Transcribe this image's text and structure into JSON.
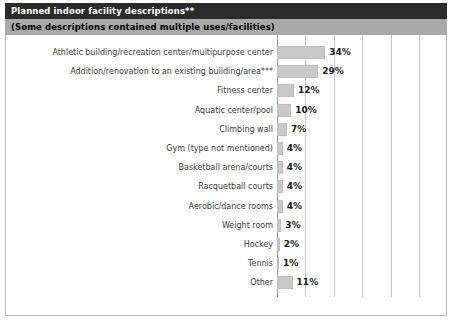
{
  "header": {
    "title": "Planned indoor facility descriptions**",
    "subtitle": "(Some descriptions contained multiple uses/facilities)"
  },
  "footer": {
    "sample_size": "n=198"
  },
  "colors": {
    "title_bar_bg": "#2b2b2b",
    "title_bar_text": "#ffffff",
    "subtitle_bar_bg": "#a9a9a9",
    "subtitle_bar_text": "#000000",
    "bar_fill": "#c9c9c9",
    "bar_border": "#bdbdbd",
    "gridline": "#c4c4c4",
    "frame_border": "#b9b9b9",
    "category_text": "#3a3a3a",
    "value_text": "#1a1a1a"
  },
  "chart_data": {
    "type": "bar",
    "orientation": "horizontal",
    "title": "Planned indoor facility descriptions**",
    "subtitle": "(Some descriptions contained multiple uses/facilities)",
    "xlabel": "",
    "ylabel": "",
    "xlim": [
      0,
      100
    ],
    "xticks": [
      0,
      20,
      40,
      60,
      80,
      100
    ],
    "xtick_labels": [
      "0%",
      "20%",
      "40%",
      "60%",
      "80%",
      "100%"
    ],
    "grid": true,
    "grid_axis": "x",
    "legend": false,
    "sample_size": "n=198",
    "units": "percent",
    "categories": [
      "Athletic building/recreation center/multipurpose center",
      "Addition/renovation to an existing building/area***",
      "Fitness center",
      "Aquatic center/pool",
      "Climbing wall",
      "Gym (type not mentioned)",
      "Basketball arena/courts",
      "Racquetball courts",
      "Aerobic/dance rooms",
      "Weight room",
      "Hockey",
      "Tennis",
      "Other"
    ],
    "values": [
      34,
      29,
      12,
      10,
      7,
      4,
      4,
      4,
      4,
      3,
      2,
      1,
      11
    ],
    "value_labels": [
      "34%",
      "29%",
      "12%",
      "10%",
      "7%",
      "4%",
      "4%",
      "4%",
      "4%",
      "3%",
      "2%",
      "1%",
      "11%"
    ]
  }
}
